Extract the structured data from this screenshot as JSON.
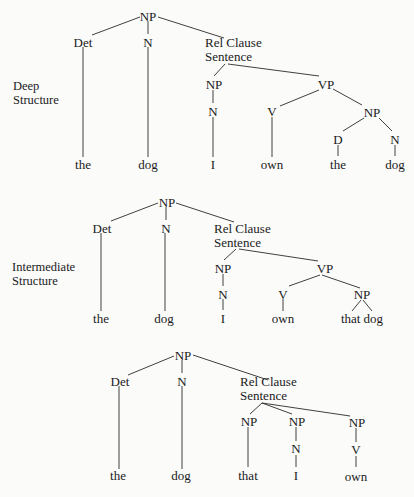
{
  "figure": {
    "section_labels": {
      "deep": [
        "Deep",
        "Structure"
      ],
      "intermediate": [
        "Intermediate",
        "Structure"
      ]
    },
    "colors": {
      "ink": "#1a1a1a",
      "background": "#fbfbfa"
    }
  },
  "trees": [
    {
      "name": "deep-structure",
      "nodes": {
        "root": "NP",
        "det": "Det",
        "n": "N",
        "rel1": "Rel Clause",
        "rel2": "Sentence",
        "s_np": "NP",
        "s_vp": "VP",
        "s_np_n": "N",
        "vp_v": "V",
        "vp_np": "NP",
        "vp_np_d": "D",
        "vp_np_n": "N"
      },
      "leaves": [
        "the",
        "dog",
        "I",
        "own",
        "the",
        "dog"
      ]
    },
    {
      "name": "intermediate-structure",
      "nodes": {
        "root": "NP",
        "det": "Det",
        "n": "N",
        "rel1": "Rel Clause",
        "rel2": "Sentence",
        "s_np": "NP",
        "s_vp": "VP",
        "s_np_n": "N",
        "vp_v": "V",
        "vp_np": "NP"
      },
      "leaves": [
        "the",
        "dog",
        "I",
        "own",
        "that dog"
      ]
    },
    {
      "name": "surface-structure",
      "nodes": {
        "root": "NP",
        "det": "Det",
        "n": "N",
        "rel1": "Rel Clause",
        "rel2": "Sentence",
        "np1": "NP",
        "np2": "NP",
        "np3": "NP",
        "np2_n": "N",
        "np3_v": "V"
      },
      "leaves": [
        "the",
        "dog",
        "that",
        "I",
        "own"
      ]
    }
  ]
}
